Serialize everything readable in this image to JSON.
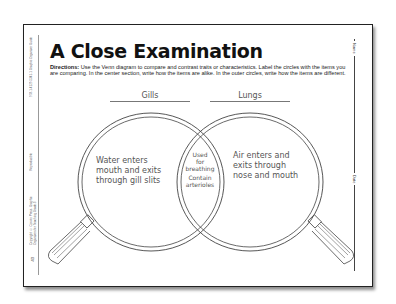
{
  "worksheet": {
    "title": "A Close Examination",
    "directions_label": "Directions:",
    "directions_text": "Use the Venn diagram to compare and contrast traits or characteristics. Label the circles with the items you are comparing. In the center section, write how the items are alike. In the outer circles, write how the items are different.",
    "name_label": "Name",
    "date_label": "Date",
    "side_text_top": "978-1-4129-5341-1 Graphic Organizer Guide",
    "side_text_mid": "Reproducible",
    "side_text_bottom": "Copyright © Corwin Press. Graphic Organizers for Teaching Grade 3",
    "page_mark": "43"
  },
  "venn": {
    "left_label": "Gills",
    "right_label": "Lungs",
    "left_text": [
      "Water enters",
      "mouth and exits",
      "through gill slits"
    ],
    "center_text": [
      "Used",
      "for",
      "breathing",
      "Contain",
      "arterioles"
    ],
    "right_text": [
      "Air enters and",
      "exits through",
      "nose and mouth"
    ]
  }
}
